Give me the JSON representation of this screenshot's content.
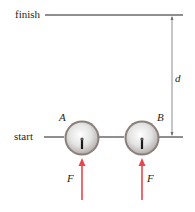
{
  "diagram": {
    "lines": {
      "finish_label": "finish",
      "start_label": "start"
    },
    "dimension": {
      "label": "d"
    },
    "pucks": [
      {
        "label": "A",
        "force_label": "F"
      },
      {
        "label": "B",
        "force_label": "F"
      }
    ],
    "colors": {
      "line": "#231f20",
      "dimension": "#6d6e71",
      "force_arrow": "#e8474f",
      "puck_fill": "#e6e6e6",
      "puck_rim": "#8a7f7a"
    }
  }
}
